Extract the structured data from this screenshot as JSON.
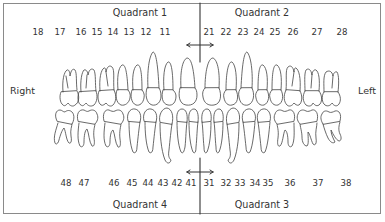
{
  "figure": {
    "quadrants": {
      "q1": "Quadrant 1",
      "q2": "Quadrant 2",
      "q3": "Quadrant 3",
      "q4": "Quadrant 4"
    },
    "sides": {
      "right": "Right",
      "left": "Left"
    },
    "upper_numbers": [
      {
        "label": "18",
        "x": 38
      },
      {
        "label": "17",
        "x": 60
      },
      {
        "label": "16",
        "x": 81
      },
      {
        "label": "15",
        "x": 97
      },
      {
        "label": "14",
        "x": 113
      },
      {
        "label": "13",
        "x": 129
      },
      {
        "label": "12",
        "x": 146
      },
      {
        "label": "11",
        "x": 165
      },
      {
        "label": "21",
        "x": 209
      },
      {
        "label": "22",
        "x": 226
      },
      {
        "label": "23",
        "x": 243
      },
      {
        "label": "24",
        "x": 259
      },
      {
        "label": "25",
        "x": 275
      },
      {
        "label": "26",
        "x": 293
      },
      {
        "label": "27",
        "x": 317
      },
      {
        "label": "28",
        "x": 342
      }
    ],
    "lower_numbers": [
      {
        "label": "48",
        "x": 66
      },
      {
        "label": "47",
        "x": 84
      },
      {
        "label": "46",
        "x": 114
      },
      {
        "label": "45",
        "x": 132
      },
      {
        "label": "44",
        "x": 148
      },
      {
        "label": "43",
        "x": 163
      },
      {
        "label": "42",
        "x": 177
      },
      {
        "label": "41",
        "x": 191
      },
      {
        "label": "31",
        "x": 209
      },
      {
        "label": "32",
        "x": 226
      },
      {
        "label": "33",
        "x": 240
      },
      {
        "label": "34",
        "x": 255
      },
      {
        "label": "35",
        "x": 268
      },
      {
        "label": "36",
        "x": 290
      },
      {
        "label": "37",
        "x": 318
      },
      {
        "label": "38",
        "x": 346
      }
    ],
    "colors": {
      "line": "#333333",
      "border": "#8a8a8a",
      "tooth_stroke": "#444444",
      "background": "#ffffff"
    }
  }
}
